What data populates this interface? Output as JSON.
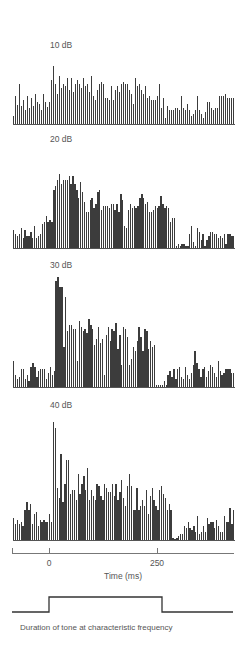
{
  "chart_data": {
    "type": "bar",
    "title": "",
    "xlabel": "Time (ms)",
    "ylabel": "",
    "xlim": [
      -85,
      425
    ],
    "x_ticks": [
      0,
      250
    ],
    "x_tick_labels": [
      "0",
      "250"
    ],
    "bin_width_ms": 4.6,
    "bin_start_ms": -85,
    "grid": false,
    "legend": null,
    "panel_layout": "vertical-stack",
    "stimulus": {
      "label": "Duration of tone at characteristic frequency",
      "onset_ms": 0,
      "offset_ms": 262
    },
    "series": [
      {
        "name": "10 dB",
        "values": [
          8,
          28,
          19,
          40,
          18,
          24,
          14,
          28,
          16,
          26,
          18,
          30,
          22,
          20,
          14,
          30,
          22,
          17,
          22,
          44,
          58,
          40,
          30,
          48,
          36,
          40,
          38,
          46,
          34,
          46,
          32,
          40,
          44,
          40,
          36,
          46,
          38,
          40,
          32,
          48,
          28,
          24,
          34,
          40,
          42,
          40,
          26,
          26,
          24,
          38,
          24,
          34,
          38,
          32,
          40,
          42,
          40,
          40,
          34,
          30,
          20,
          46,
          38,
          40,
          34,
          30,
          38,
          26,
          28,
          24,
          24,
          24,
          28,
          40,
          16,
          26,
          6,
          18,
          14,
          14,
          14,
          16,
          16,
          14,
          28,
          16,
          14,
          20,
          14,
          8,
          10,
          14,
          28,
          14,
          10,
          6,
          12,
          22,
          22,
          16,
          14,
          16,
          16,
          28,
          28,
          28,
          30,
          26,
          26,
          26,
          26
        ],
        "color": "#3c3c3c"
      },
      {
        "name": "20 dB",
        "values": [
          18,
          14,
          12,
          14,
          20,
          10,
          18,
          12,
          12,
          16,
          10,
          22,
          10,
          12,
          14,
          24,
          26,
          32,
          26,
          28,
          26,
          58,
          62,
          68,
          74,
          64,
          68,
          68,
          68,
          72,
          64,
          72,
          64,
          58,
          50,
          66,
          56,
          46,
          36,
          36,
          48,
          50,
          40,
          44,
          56,
          58,
          38,
          42,
          42,
          42,
          40,
          44,
          44,
          38,
          44,
          36,
          54,
          48,
          22,
          20,
          38,
          44,
          40,
          42,
          40,
          42,
          50,
          54,
          50,
          44,
          46,
          36,
          36,
          38,
          42,
          40,
          42,
          52,
          44,
          40,
          42,
          40,
          26,
          30,
          30,
          2,
          4,
          2,
          4,
          4,
          2,
          2,
          14,
          22,
          6,
          2,
          20,
          16,
          8,
          14,
          2,
          8,
          12,
          16,
          16,
          14,
          14,
          10,
          12,
          10,
          14,
          4,
          14,
          14,
          12,
          12
        ],
        "color": "#3c3c3c"
      },
      {
        "name": "30 dB",
        "values": [
          26,
          12,
          8,
          10,
          18,
          18,
          8,
          12,
          6,
          20,
          24,
          20,
          10,
          16,
          18,
          18,
          18,
          8,
          14,
          20,
          12,
          16,
          106,
          110,
          100,
          100,
          40,
          90,
          56,
          62,
          62,
          58,
          58,
          26,
          66,
          60,
          56,
          58,
          54,
          68,
          62,
          58,
          42,
          48,
          60,
          44,
          48,
          12,
          52,
          60,
          46,
          58,
          56,
          64,
          38,
          52,
          22,
          60,
          58,
          50,
          22,
          28,
          40,
          36,
          46,
          60,
          50,
          36,
          58,
          56,
          38,
          46,
          40,
          42,
          2,
          2,
          2,
          2,
          6,
          2,
          12,
          16,
          10,
          18,
          8,
          18,
          20,
          10,
          8,
          20,
          12,
          8,
          14,
          22,
          36,
          24,
          18,
          10,
          18,
          20,
          10,
          16,
          22,
          20,
          14,
          10,
          26,
          16,
          12,
          14,
          18,
          18,
          18,
          14,
          14
        ],
        "color": "#3c3c3c"
      },
      {
        "name": "40 dB",
        "values": [
          22,
          16,
          20,
          16,
          18,
          14,
          30,
          38,
          30,
          36,
          16,
          26,
          28,
          14,
          20,
          18,
          20,
          18,
          18,
          26,
          18,
          118,
          112,
          52,
          42,
          86,
          38,
          56,
          80,
          80,
          46,
          50,
          50,
          40,
          66,
          46,
          56,
          64,
          50,
          72,
          40,
          50,
          44,
          40,
          56,
          54,
          44,
          40,
          56,
          52,
          48,
          48,
          56,
          44,
          56,
          40,
          48,
          60,
          42,
          34,
          54,
          66,
          54,
          30,
          30,
          52,
          30,
          34,
          40,
          34,
          50,
          26,
          44,
          52,
          40,
          34,
          30,
          50,
          54,
          46,
          42,
          30,
          36,
          30,
          2,
          0,
          2,
          4,
          6,
          6,
          14,
          12,
          18,
          12,
          10,
          14,
          8,
          24,
          6,
          8,
          14,
          8,
          22,
          16,
          18,
          18,
          12,
          20,
          14,
          8,
          8,
          24,
          18,
          18,
          32,
          16,
          30
        ],
        "color": "#3c3c3c"
      }
    ]
  },
  "panels": [
    {
      "label": "10 dB"
    },
    {
      "label": "20 dB"
    },
    {
      "label": "30 dB"
    },
    {
      "label": "40 dB"
    }
  ],
  "axis": {
    "ticks": [
      {
        "label": "0"
      },
      {
        "label": "250"
      }
    ],
    "title": "Time (ms)"
  },
  "stimulus": {
    "caption": "Duration of tone at characteristic frequency"
  }
}
